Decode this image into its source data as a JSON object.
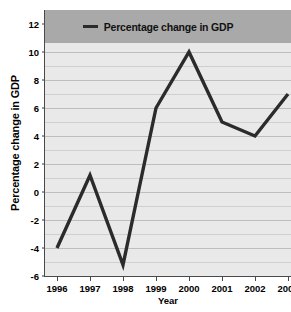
{
  "chart_data": {
    "type": "line",
    "title": "",
    "xlabel": "Year",
    "ylabel": "Percentage change in GDP",
    "categories": [
      "1996",
      "1997",
      "1998",
      "1999",
      "2000",
      "2001",
      "2002",
      "2003"
    ],
    "series": [
      {
        "name": "Percentage change in GDP",
        "values": [
          -4,
          1.2,
          -5.2,
          6,
          10,
          5,
          4,
          7
        ],
        "color": "#2b2b2b"
      }
    ],
    "ylim": [
      -6,
      13
    ],
    "y_major_ticks": [
      12,
      10,
      8,
      6,
      4,
      2,
      0,
      -2,
      -4,
      -6
    ],
    "y_major_tick_labels": [
      "12",
      "10",
      "8",
      "6",
      "4",
      "2",
      "0",
      "-2",
      "-4",
      "-6"
    ],
    "y_minor_step": 1,
    "grid": true,
    "legend_position": "top-center",
    "legend_entries": [
      "Percentage change in GDP"
    ],
    "plot_background": "#e9e9e9",
    "legend_background": "#a9a9a9"
  },
  "legend": {
    "label": "Percentage change in GDP"
  },
  "axes": {
    "x_title": "Year",
    "y_title": "Percentage change in GDP"
  }
}
